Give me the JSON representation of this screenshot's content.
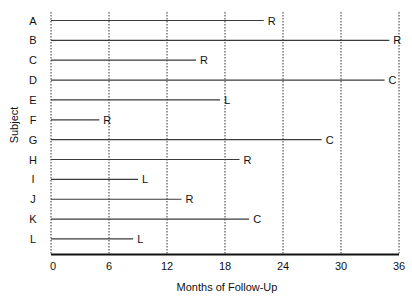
{
  "chart_data": {
    "type": "bar",
    "subtype": "horizontal follow-up timeline (swimmer plot)",
    "title": "",
    "xlabel": "Months of Follow-Up",
    "ylabel": "Subject",
    "xlim": [
      0,
      36
    ],
    "xticks": [
      0,
      6,
      12,
      18,
      24,
      30,
      36
    ],
    "xtick_labels": [
      "0",
      "6",
      "12",
      "18",
      "24",
      "30",
      "36"
    ],
    "grid": {
      "vertical": true,
      "style": "dotted"
    },
    "legend": null,
    "categories": [
      "A",
      "B",
      "C",
      "D",
      "E",
      "F",
      "G",
      "H",
      "I",
      "J",
      "K",
      "L"
    ],
    "values": [
      22,
      35,
      15,
      34.5,
      17.5,
      5,
      28,
      19.5,
      9,
      13.5,
      20.5,
      8.5
    ],
    "end_labels": [
      "R",
      "R",
      "R",
      "C",
      "L",
      "R",
      "C",
      "R",
      "L",
      "R",
      "C",
      "L"
    ],
    "colors": {
      "line": "#3a3a3a",
      "grid": "#333333",
      "axis": "#111111",
      "text": "#111111"
    }
  }
}
